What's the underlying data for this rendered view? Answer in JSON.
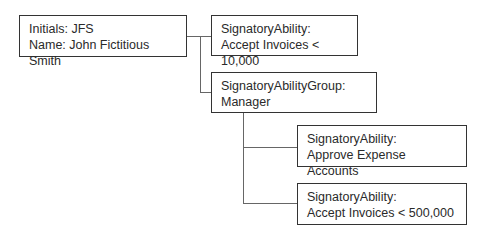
{
  "nodes": {
    "person": {
      "line1": "Initials: JFS",
      "line2": "Name: John Fictitious Smith"
    },
    "ability1": {
      "line1": "SignatoryAbility:",
      "line2": "Accept Invoices < 10,000"
    },
    "group": {
      "line1": "SignatoryAbilityGroup:",
      "line2": "Manager"
    },
    "ability2": {
      "line1": "SignatoryAbility:",
      "line2": "Approve Expense Accounts"
    },
    "ability3": {
      "line1": "SignatoryAbility:",
      "line2": "Accept Invoices < 500,000"
    }
  },
  "colors": {
    "border": "#333333",
    "connector": "#666666",
    "background": "#ffffff"
  }
}
